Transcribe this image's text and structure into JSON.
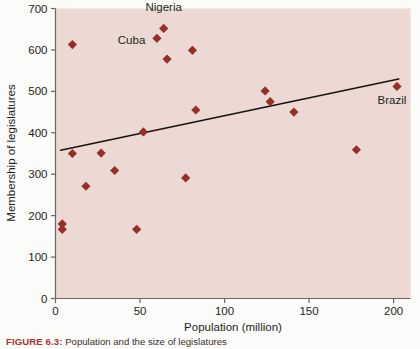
{
  "figure": {
    "caption_label": "FIGURE 6.3:",
    "caption_text": "Population and the size of legislatures"
  },
  "colors": {
    "marker": "#963024",
    "plot_background": "#ecd9d3",
    "page_background": "#fbfbf9",
    "axis": "#5d5a58",
    "trendline": "#17140f",
    "caption_label": "#a8342a",
    "text": "#231f20"
  },
  "chart_data": {
    "type": "scatter",
    "title": "",
    "xlabel": "Population (million)",
    "ylabel": "Membership of legislatures",
    "xlim": [
      0,
      210
    ],
    "ylim": [
      0,
      700
    ],
    "xticks": [
      0,
      50,
      100,
      150,
      200
    ],
    "xtick_labels": [
      "0",
      "50",
      "100",
      "150",
      "200"
    ],
    "yticks": [
      0,
      100,
      200,
      300,
      400,
      500,
      600,
      700
    ],
    "ytick_labels": [
      "0",
      "100",
      "200",
      "300",
      "400",
      "500",
      "600",
      "700"
    ],
    "grid": false,
    "legend": false,
    "marker": "diamond",
    "points": [
      {
        "x": 4,
        "y": 180
      },
      {
        "x": 4,
        "y": 167
      },
      {
        "x": 10,
        "y": 613
      },
      {
        "x": 10,
        "y": 350
      },
      {
        "x": 18,
        "y": 271
      },
      {
        "x": 27,
        "y": 351
      },
      {
        "x": 35,
        "y": 309
      },
      {
        "x": 48,
        "y": 167
      },
      {
        "x": 52,
        "y": 402
      },
      {
        "x": 60,
        "y": 628,
        "label": "Cuba"
      },
      {
        "x": 64,
        "y": 652,
        "label": "Nigeria"
      },
      {
        "x": 66,
        "y": 578
      },
      {
        "x": 77,
        "y": 291
      },
      {
        "x": 81,
        "y": 599
      },
      {
        "x": 83,
        "y": 455
      },
      {
        "x": 124,
        "y": 501
      },
      {
        "x": 127,
        "y": 475
      },
      {
        "x": 141,
        "y": 450
      },
      {
        "x": 178,
        "y": 359
      },
      {
        "x": 202,
        "y": 512,
        "label": "Brazil"
      }
    ],
    "trendline": {
      "x0": 3,
      "y0": 358,
      "x1": 203,
      "y1": 530
    },
    "annotations": [
      {
        "text": "Nigeria",
        "x": 64,
        "y": 695,
        "anchor": "middle"
      },
      {
        "text": "Cuba",
        "x": 45,
        "y": 615,
        "anchor": "middle"
      },
      {
        "text": "Brazil",
        "x": 199,
        "y": 470,
        "anchor": "middle"
      }
    ]
  }
}
